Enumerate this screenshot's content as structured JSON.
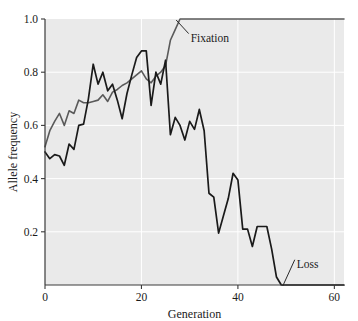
{
  "chart_data": {
    "type": "line",
    "title": "",
    "xlabel": "Generation",
    "ylabel": "Allele frequency",
    "xlim": [
      0,
      62
    ],
    "ylim": [
      0,
      1.0
    ],
    "grid": true,
    "grid_color": "#ffffff",
    "plot_background": "#eaeaea",
    "legend": "none",
    "xticks": [
      0,
      20,
      40,
      60
    ],
    "xtick_labels": [
      "0",
      "20",
      "40",
      "60"
    ],
    "yticks": [
      0.2,
      0.4,
      0.6,
      0.8,
      1.0
    ],
    "ytick_labels": [
      "0.2",
      "0.4",
      "0.6",
      "0.8",
      "1.0"
    ],
    "annotations": [
      {
        "text": "Fixation",
        "x": 30,
        "y": 0.93
      },
      {
        "text": "Loss",
        "x": 52,
        "y": 0.08
      }
    ],
    "series": [
      {
        "name": "Fixation",
        "color": "#5a5a5a",
        "width": 1.6,
        "x": [
          0,
          1,
          2,
          3,
          4,
          5,
          6,
          7,
          8,
          9,
          10,
          11,
          12,
          13,
          14,
          15,
          16,
          17,
          18,
          19,
          20,
          21,
          22,
          23,
          24,
          25,
          26,
          27,
          28,
          29,
          30,
          35,
          40,
          45,
          50,
          55,
          60,
          62
        ],
        "values": [
          0.52,
          0.58,
          0.615,
          0.645,
          0.6,
          0.655,
          0.645,
          0.695,
          0.685,
          0.685,
          0.69,
          0.695,
          0.715,
          0.69,
          0.725,
          0.735,
          0.75,
          0.76,
          0.775,
          0.79,
          0.805,
          0.775,
          0.76,
          0.785,
          0.8,
          0.825,
          0.92,
          0.96,
          1.0,
          1.0,
          1.0,
          1.0,
          1.0,
          1.0,
          1.0,
          1.0,
          1.0,
          1.0
        ]
      },
      {
        "name": "Loss",
        "color": "#1a1a1a",
        "width": 1.7,
        "x": [
          0,
          1,
          2,
          3,
          4,
          5,
          6,
          7,
          8,
          9,
          10,
          11,
          12,
          13,
          14,
          15,
          16,
          17,
          18,
          19,
          20,
          21,
          22,
          23,
          24,
          25,
          26,
          27,
          28,
          29,
          30,
          31,
          32,
          33,
          34,
          35,
          36,
          37,
          38,
          39,
          40,
          41,
          42,
          43,
          44,
          45,
          46,
          47,
          48,
          49,
          50,
          55,
          60,
          62
        ],
        "values": [
          0.5,
          0.475,
          0.49,
          0.485,
          0.45,
          0.53,
          0.51,
          0.6,
          0.605,
          0.7,
          0.83,
          0.755,
          0.8,
          0.73,
          0.755,
          0.695,
          0.625,
          0.72,
          0.79,
          0.855,
          0.88,
          0.88,
          0.675,
          0.8,
          0.755,
          0.845,
          0.565,
          0.63,
          0.6,
          0.545,
          0.615,
          0.585,
          0.66,
          0.58,
          0.345,
          0.33,
          0.195,
          0.26,
          0.325,
          0.42,
          0.395,
          0.21,
          0.21,
          0.145,
          0.22,
          0.22,
          0.22,
          0.135,
          0.03,
          0.0,
          0.0,
          0.0,
          0.0,
          0.0
        ]
      }
    ]
  }
}
